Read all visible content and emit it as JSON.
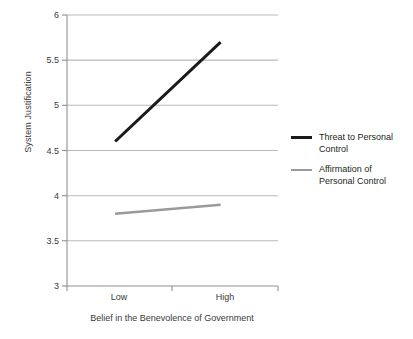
{
  "chart_data": {
    "type": "line",
    "title": "",
    "subtitle": "",
    "xlabel": "Belief in the Benevolence of Government",
    "ylabel": "System Justification",
    "categories": [
      "Low",
      "High"
    ],
    "xtick_labels": [
      "Low",
      "High"
    ],
    "ytick_labels": [
      "3",
      "3.5",
      "4",
      "4.5",
      "5",
      "5.5",
      "6"
    ],
    "ytick_values": [
      3,
      3.5,
      4,
      4.5,
      5,
      5.5,
      6
    ],
    "ylim": [
      3,
      6
    ],
    "grid": "horizontal",
    "legend_position": "right",
    "series": [
      {
        "name": "Threat to Personal Control",
        "label_lines": [
          "Threat to Personal",
          "Control"
        ],
        "values": [
          4.6,
          5.7
        ],
        "color": "#1a1a1a",
        "line_width": 3
      },
      {
        "name": "Affirmation of Personal Control",
        "label_lines": [
          "Affirmation of",
          "Personal Control"
        ],
        "values": [
          3.8,
          3.9
        ],
        "color": "#9a9a9a",
        "line_width": 2.4
      }
    ],
    "annotations": [],
    "colors": {
      "axis": "#8c8c8c",
      "grid": "#bfbfbf",
      "text": "#3a3a3a",
      "background": "#ffffff"
    }
  },
  "legend": {
    "entries": [
      {
        "line1": "Threat to Personal",
        "line2": "Control"
      },
      {
        "line1": "Affirmation of",
        "line2": "Personal Control"
      }
    ]
  },
  "axes": {
    "y_label": "System Justification",
    "x_label": "Belief in the Benevolence of Government",
    "y_ticks": [
      "6",
      "5.5",
      "5",
      "4.5",
      "4",
      "3.5",
      "3"
    ],
    "x_ticks": [
      "Low",
      "High"
    ]
  }
}
